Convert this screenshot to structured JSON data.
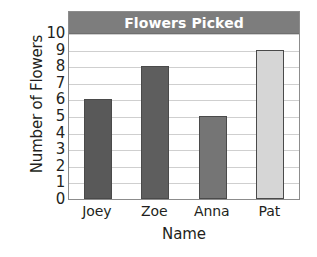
{
  "chart_data": {
    "type": "bar",
    "title": "Flowers Picked",
    "xlabel": "Name",
    "ylabel": "Number of Flowers",
    "categories": [
      "Joey",
      "Zoe",
      "Anna",
      "Pat"
    ],
    "values": [
      6,
      8,
      5,
      9
    ],
    "ylim": [
      0,
      10
    ],
    "y_ticks": [
      "0",
      "1",
      "2",
      "3",
      "4",
      "5",
      "6",
      "7",
      "8",
      "9",
      "10"
    ],
    "y_tick_values": [
      0,
      1,
      2,
      3,
      4,
      5,
      6,
      7,
      8,
      9,
      10
    ],
    "grid": true,
    "legend": "none",
    "bar_colors": [
      "#595959",
      "#5e5e5e",
      "#757575",
      "#d6d6d6"
    ],
    "bar_border_color": "#4a4a4a",
    "title_banner_color": "#7d7d7d",
    "title_text_color": "#ffffff",
    "gridline_color": "#cfcfcf",
    "frame_color": "#8c8c8c",
    "text_color": "#231f20",
    "background_color": "#ffffff"
  }
}
